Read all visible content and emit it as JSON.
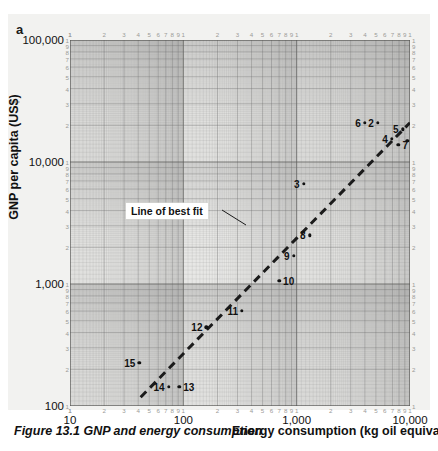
{
  "panel": {
    "letter": "a"
  },
  "caption": {
    "text": "Figure 13.1 GNP and energy consumption"
  },
  "axes": {
    "x_title": "Energy consumption (kg oil equivalent)",
    "y_title": "GNP per capita (US$)",
    "x_major_labels": [
      "10",
      "100",
      "1,000",
      "10,000"
    ],
    "y_major_labels": [
      "100,000",
      "10,000",
      "1,000",
      "100"
    ],
    "minor_labels": [
      "2",
      "3",
      "4",
      "5",
      "6",
      "7",
      "8",
      "9",
      "1"
    ],
    "minor_labels_desc": [
      "1",
      "9",
      "8",
      "7",
      "6",
      "5",
      "4",
      "3",
      "2"
    ]
  },
  "annotation": {
    "label": "Line of best fit"
  },
  "chart_data": {
    "type": "scatter",
    "title": "Figure 13.1 GNP and energy consumption",
    "xlabel": "Energy consumption (kg oil equivalent)",
    "ylabel": "GNP per capita (US$)",
    "xscale": "log",
    "yscale": "log",
    "xlim": [
      10,
      10000
    ],
    "ylim": [
      100,
      100000
    ],
    "grid": true,
    "legend": "none",
    "annotations": [
      {
        "text": "Line of best fit",
        "points_to": "trendline"
      }
    ],
    "trendline": {
      "type": "line-of-best-fit",
      "style": "dashed",
      "x_start": 42,
      "y_start": 118,
      "x_end": 10000,
      "y_end": 21000
    },
    "points": [
      {
        "label": "1",
        "x": 9500,
        "y": 15000,
        "label_pos": "right"
      },
      {
        "label": "2",
        "x": 5200,
        "y": 21000,
        "label_pos": "left"
      },
      {
        "label": "3",
        "x": 1150,
        "y": 6600,
        "label_pos": "left"
      },
      {
        "label": "4",
        "x": 6900,
        "y": 15500,
        "label_pos": "left"
      },
      {
        "label": "5",
        "x": 8600,
        "y": 18500,
        "label_pos": "left"
      },
      {
        "label": "6",
        "x": 4000,
        "y": 21000,
        "label_pos": "left"
      },
      {
        "label": "7",
        "x": 7900,
        "y": 13800,
        "label_pos": "right"
      },
      {
        "label": "8",
        "x": 1300,
        "y": 2500,
        "label_pos": "left"
      },
      {
        "label": "9",
        "x": 940,
        "y": 1700,
        "label_pos": "left"
      },
      {
        "label": "10",
        "x": 700,
        "y": 1060,
        "label_pos": "right"
      },
      {
        "label": "11",
        "x": 330,
        "y": 600,
        "label_pos": "left"
      },
      {
        "label": "12",
        "x": 160,
        "y": 440,
        "label_pos": "left"
      },
      {
        "label": "13",
        "x": 92,
        "y": 143,
        "label_pos": "right"
      },
      {
        "label": "14",
        "x": 74,
        "y": 143,
        "label_pos": "left"
      },
      {
        "label": "15",
        "x": 41,
        "y": 225,
        "label_pos": "left"
      }
    ]
  }
}
